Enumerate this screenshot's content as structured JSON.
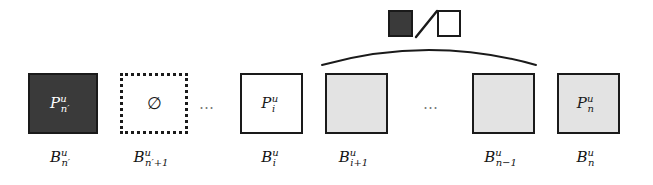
{
  "figure": {
    "type": "block-sequence-diagram",
    "colors": {
      "dark_fill": "#3a3a3a",
      "light_fill": "#e3e3e3",
      "white_fill": "#ffffff",
      "stroke": "#1a1a1a",
      "ellipsis": "#7a7a7a"
    }
  },
  "legend": {
    "dark_swatch_name": "filled-block-swatch",
    "separator": "/",
    "light_swatch_name": "empty-block-swatch"
  },
  "blocks": [
    {
      "id": "block-1",
      "fill": "dark",
      "border": "solid",
      "inner_base": "P",
      "inner_sup": "u",
      "inner_sub": "n′",
      "label_base": "B",
      "label_sup": "u",
      "label_sub": "n′"
    },
    {
      "id": "block-2",
      "fill": "white",
      "border": "dotted",
      "inner_base": "∅",
      "inner_sup": "",
      "inner_sub": "",
      "label_base": "B",
      "label_sup": "u",
      "label_sub": "n′+1"
    },
    {
      "id": "block-3",
      "fill": "white",
      "border": "solid",
      "inner_base": "P",
      "inner_sup": "u",
      "inner_sub": "i",
      "label_base": "B",
      "label_sup": "u",
      "label_sub": "i"
    },
    {
      "id": "block-4",
      "fill": "light",
      "border": "solid",
      "inner_base": "",
      "inner_sup": "",
      "inner_sub": "",
      "label_base": "B",
      "label_sup": "u",
      "label_sub": "i+1"
    },
    {
      "id": "block-5",
      "fill": "light",
      "border": "solid",
      "inner_base": "",
      "inner_sup": "",
      "inner_sub": "",
      "label_base": "B",
      "label_sup": "u",
      "label_sub": "n−1"
    },
    {
      "id": "block-6",
      "fill": "light",
      "border": "solid",
      "inner_base": "P",
      "inner_sup": "u",
      "inner_sub": "n",
      "label_base": "B",
      "label_sup": "u",
      "label_sub": "n"
    }
  ],
  "ellipses": [
    {
      "id": "ellipsis-1",
      "text": "…"
    },
    {
      "id": "ellipsis-2",
      "text": "…"
    }
  ]
}
